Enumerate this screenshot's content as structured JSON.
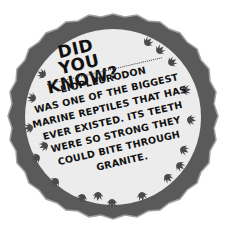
{
  "badge": {
    "title_lines": [
      "DID YOU",
      "KNOW?"
    ],
    "body_lines": [
      "LIOPLEURODON",
      "WAS ONE OF THE BIGGEST",
      "MARINE REPTILES THAT HAS",
      "EVER EXISTED. ITS TEETH",
      "WERE SO STRONG THEY",
      "COULD BITE THROUGH",
      "GRANITE."
    ],
    "colors": {
      "ring": "#5a5a5a",
      "ring_edge": "#9a9a9a",
      "disk": "#ececec",
      "footprint": "#4a4a4a",
      "text": "#111111"
    },
    "decoration": "dinosaur-footprints"
  }
}
